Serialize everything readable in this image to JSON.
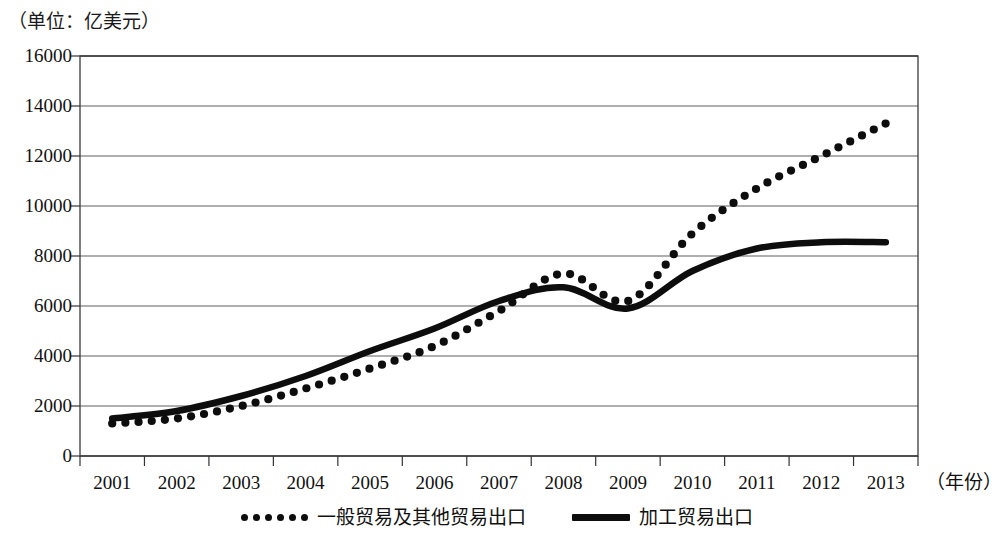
{
  "unit_label": "（单位：亿美元）",
  "axis": {
    "x_title": "（年份）",
    "y_ticks": [
      "16000",
      "14000",
      "12000",
      "10000",
      "8000",
      "6000",
      "4000",
      "2000",
      "0"
    ],
    "x_ticks": [
      "2001",
      "2002",
      "2003",
      "2004",
      "2005",
      "2006",
      "2007",
      "2008",
      "2009",
      "2010",
      "2011",
      "2012",
      "2013"
    ]
  },
  "legend": {
    "items": [
      {
        "label": "一般贸易及其他贸易出口",
        "style": "dotted",
        "color": "#0d0d0d"
      },
      {
        "label": "加工贸易出口",
        "style": "solid",
        "color": "#0d0d0d"
      }
    ]
  },
  "chart_data": {
    "type": "line",
    "title": "",
    "subtitle": "",
    "xlabel": "（年份）",
    "ylabel": "（单位：亿美元）",
    "xlim": [
      2001,
      2013
    ],
    "ylim": [
      0,
      16000
    ],
    "ytick_step": 2000,
    "grid": true,
    "legend_position": "bottom",
    "x": [
      2001,
      2002,
      2003,
      2004,
      2005,
      2006,
      2007,
      2008,
      2009,
      2010,
      2011,
      2012,
      2013
    ],
    "series": [
      {
        "name": "一般贸易及其他贸易出口",
        "style": "dotted",
        "color": "#0d0d0d",
        "values": [
          1300,
          1500,
          2000,
          2700,
          3500,
          4400,
          5800,
          7300,
          6200,
          8900,
          10700,
          12000,
          13300
        ]
      },
      {
        "name": "加工贸易出口",
        "style": "solid",
        "color": "#0d0d0d",
        "values": [
          1500,
          1800,
          2400,
          3200,
          4200,
          5100,
          6200,
          6750,
          5900,
          7400,
          8300,
          8550,
          8550
        ]
      }
    ],
    "annotations": [
      {
        "text": "2008年加工贸易出口峰值",
        "x": 2008,
        "y": 6750
      },
      {
        "text": "2009年金融危机低谷",
        "x": 2009,
        "y": 5900
      }
    ]
  }
}
